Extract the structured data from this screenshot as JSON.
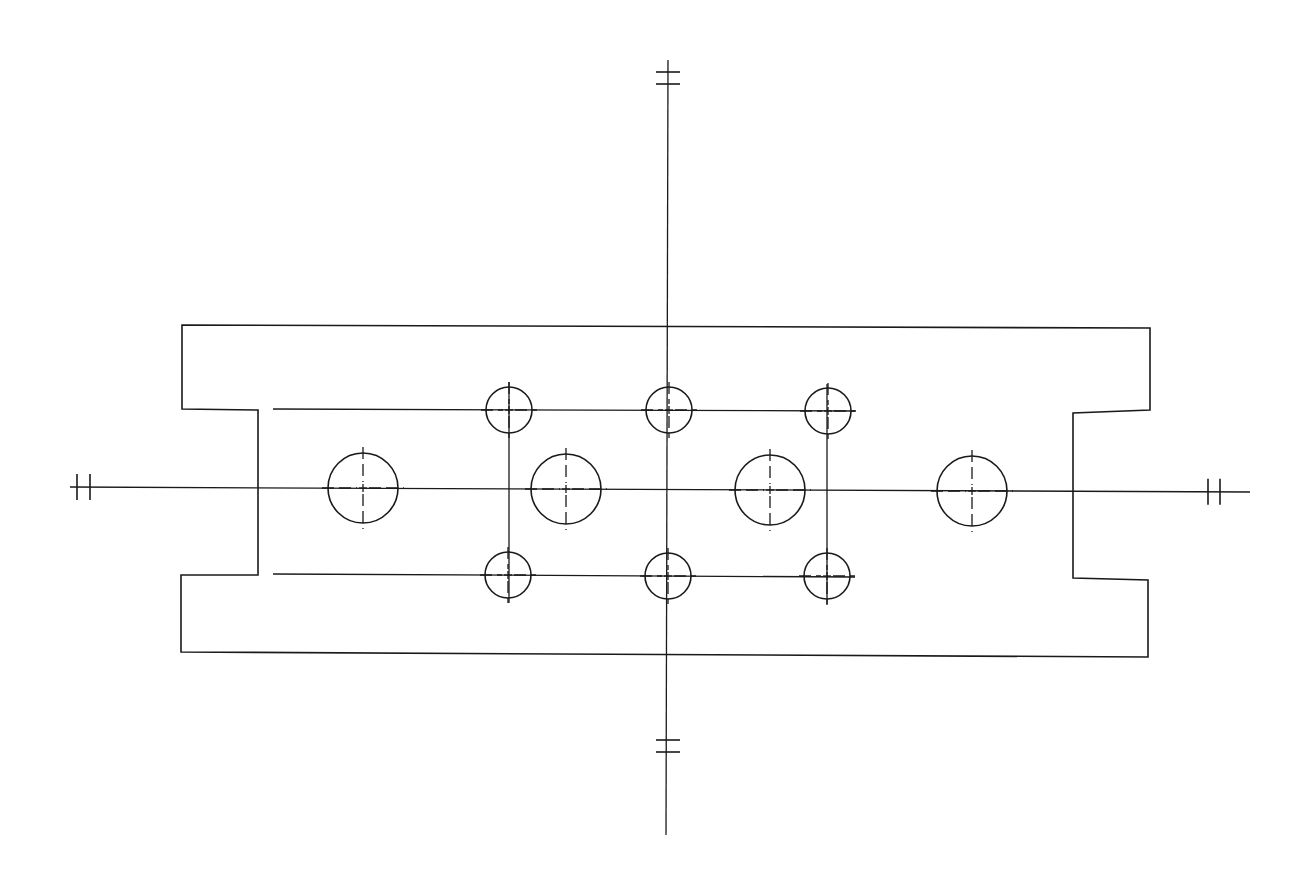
{
  "drawing": {
    "type": "technical-line-drawing",
    "subject": "rectangular plate with symmetric end notches and hole pattern",
    "colors": {
      "line": "#1a1a1a",
      "background": "#ffffff"
    },
    "plate_outline": [
      [
        182,
        325
      ],
      [
        1150,
        328
      ],
      [
        1150,
        410
      ],
      [
        1073,
        413
      ],
      [
        1073,
        578
      ],
      [
        1148,
        580
      ],
      [
        1148,
        657
      ],
      [
        181,
        652
      ],
      [
        181,
        575
      ],
      [
        258,
        575
      ],
      [
        258,
        410
      ],
      [
        182,
        409
      ]
    ],
    "center_lines": {
      "vertical_main": {
        "x1": 668,
        "y1": 60,
        "x2": 666,
        "y2": 835,
        "break_marks_y": [
          72,
          84,
          740,
          752
        ]
      },
      "horizontal_main": {
        "x1": 70,
        "y1": 487,
        "x2": 1250,
        "y2": 492,
        "break_marks_x": [
          77,
          90,
          1208,
          1220
        ]
      },
      "bolt_row_top": {
        "x1": 273,
        "y1": 409,
        "x2": 855,
        "y2": 411
      },
      "bolt_row_bottom": {
        "x1": 273,
        "y1": 574,
        "x2": 855,
        "y2": 577
      },
      "bolt_col_left": {
        "x1": 509,
        "y1": 382,
        "x2": 509,
        "y2": 603
      },
      "bolt_col_right": {
        "x1": 827,
        "y1": 384,
        "x2": 827,
        "y2": 605
      }
    },
    "large_holes": [
      {
        "cx": 363,
        "cy": 488,
        "r": 35
      },
      {
        "cx": 566,
        "cy": 489,
        "r": 35
      },
      {
        "cx": 770,
        "cy": 490,
        "r": 35
      },
      {
        "cx": 972,
        "cy": 491,
        "r": 35
      }
    ],
    "small_holes": [
      {
        "cx": 509,
        "cy": 410,
        "r": 23
      },
      {
        "cx": 669,
        "cy": 410,
        "r": 23
      },
      {
        "cx": 828,
        "cy": 411,
        "r": 23
      },
      {
        "cx": 508,
        "cy": 575,
        "r": 23
      },
      {
        "cx": 668,
        "cy": 576,
        "r": 23
      },
      {
        "cx": 827,
        "cy": 576,
        "r": 23
      }
    ]
  }
}
